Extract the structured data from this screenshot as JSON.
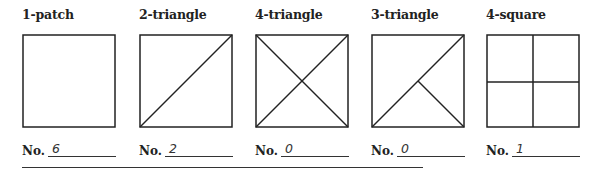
{
  "patterns": [
    {
      "label": "1-patch",
      "count": "6",
      "shape": "square"
    },
    {
      "label": "2-triangle",
      "count": "2",
      "shape": "one-diagonal"
    },
    {
      "label": "4-triangle",
      "count": "0",
      "shape": "two-diagonals"
    },
    {
      "label": "3-triangle",
      "count": "0",
      "shape": "diagonal-plus-half"
    },
    {
      "label": "4-square",
      "count": "1",
      "shape": "quartered-square"
    }
  ],
  "count_prefix": "No.",
  "colors": {
    "line": "#222222",
    "background": "#ffffff"
  }
}
